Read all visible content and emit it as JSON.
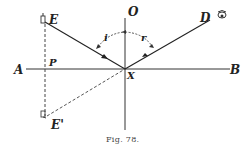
{
  "figure": {
    "caption": "Fig. 78.",
    "labels": {
      "E": "E",
      "E_prime": "E'",
      "O": "O",
      "D": "D",
      "A": "A",
      "B": "B",
      "P": "P",
      "X": "X",
      "i": "i",
      "r": "r"
    }
  },
  "colors": {
    "ink": "#222222",
    "faint": "#555555"
  }
}
